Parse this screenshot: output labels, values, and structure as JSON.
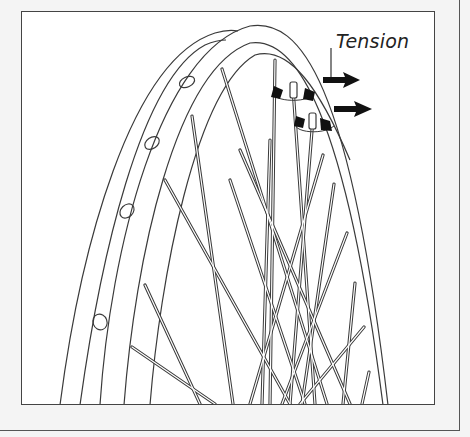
{
  "figure": {
    "annotation": {
      "label": "Tension",
      "arrows": 2,
      "arrow_direction": "right"
    },
    "rotation_markers": 2,
    "rim_holes": 5,
    "colors": {
      "ink": "#3a3a3a",
      "fill": "#111111",
      "paper": "#ffffff",
      "margin": "#f4f4f4"
    }
  }
}
